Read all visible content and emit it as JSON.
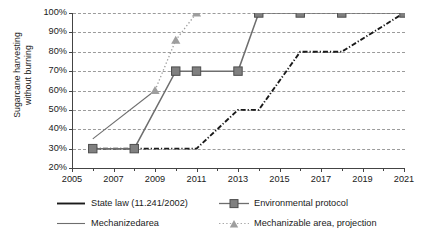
{
  "chart_data": {
    "type": "line",
    "title": "",
    "xlabel": "",
    "ylabel": "Sugarcane harvesting without burning",
    "ylabel_line1": "Sugarcane harvesting",
    "ylabel_line2": "without burning",
    "xlim": [
      2005,
      2021
    ],
    "ylim": [
      20,
      100
    ],
    "ytick_values": [
      20,
      30,
      40,
      50,
      60,
      70,
      80,
      90,
      100
    ],
    "ytick_labels": [
      "20%",
      "30%",
      "40%",
      "50%",
      "60%",
      "70%",
      "80%",
      "90%",
      "100%"
    ],
    "xtick_values": [
      2005,
      2007,
      2009,
      2011,
      2013,
      2015,
      2017,
      2019,
      2021
    ],
    "xtick_labels": [
      "2005",
      "2007",
      "2009",
      "2011",
      "2013",
      "2015",
      "2017",
      "2019",
      "2021"
    ],
    "xtick_minor_values": [
      2006,
      2008,
      2010,
      2012,
      2014,
      2016,
      2018,
      2020
    ],
    "grid": "horizontal-dashed",
    "legend_position": "bottom",
    "series": [
      {
        "name": "State law (11.241/2002)",
        "style": "dash-dot",
        "color": "#1a1a1a",
        "marker": "none",
        "x": [
          2006,
          2011,
          2013,
          2014,
          2016,
          2018,
          2021
        ],
        "y": [
          30,
          30,
          50,
          50,
          80,
          80,
          100
        ]
      },
      {
        "name": "Environmental protocol",
        "style": "solid",
        "color": "#6e6e6e",
        "marker": "square",
        "x": [
          2006,
          2008,
          2010,
          2011,
          2013,
          2014,
          2016,
          2018,
          2021
        ],
        "y": [
          30,
          30,
          70,
          70,
          70,
          100,
          100,
          100,
          100
        ]
      },
      {
        "name": "Mechanizedarea",
        "style": "solid-thin",
        "color": "#6e6e6e",
        "marker": "none",
        "x": [
          2006,
          2009
        ],
        "y": [
          35,
          60
        ]
      },
      {
        "name": "Mechanizable area, projection",
        "style": "dotted",
        "color": "#9e9e9e",
        "marker": "triangle",
        "x": [
          2009,
          2010,
          2011
        ],
        "y": [
          60,
          86,
          100
        ]
      }
    ]
  },
  "legend": {
    "items": [
      {
        "label": "State law (11.241/2002)"
      },
      {
        "label": "Environmental protocol"
      },
      {
        "label": "Mechanizedarea"
      },
      {
        "label": "Mechanizable area, projection"
      }
    ]
  }
}
